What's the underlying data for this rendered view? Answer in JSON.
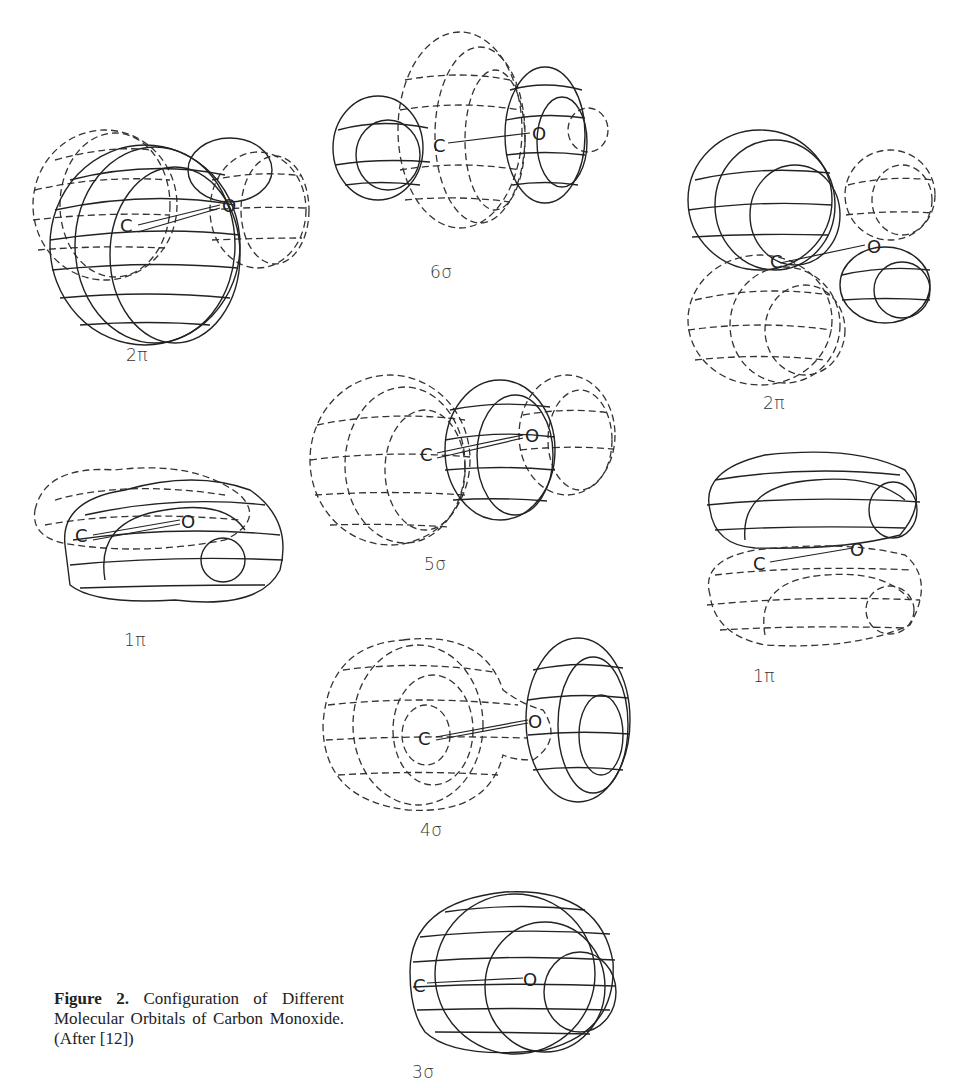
{
  "figure": {
    "caption_label": "Figure 2.",
    "caption_text": "Configuration of Different Molecular Orbitals of Carbon Monoxide. (After [12])",
    "orbitals": [
      {
        "id": "2pi-left",
        "label": "2π",
        "atoms": [
          "C",
          "O"
        ]
      },
      {
        "id": "6sigma",
        "label": "6σ",
        "atoms": [
          "C",
          "O"
        ]
      },
      {
        "id": "2pi-right",
        "label": "2π",
        "atoms": [
          "C",
          "O"
        ]
      },
      {
        "id": "5sigma",
        "label": "5σ",
        "atoms": [
          "C",
          "O"
        ]
      },
      {
        "id": "1pi-left",
        "label": "1π",
        "atoms": [
          "C",
          "O"
        ]
      },
      {
        "id": "1pi-right",
        "label": "1π",
        "atoms": [
          "C",
          "O"
        ]
      },
      {
        "id": "4sigma",
        "label": "4σ",
        "atoms": [
          "C",
          "O"
        ]
      },
      {
        "id": "3sigma",
        "label": "3σ",
        "atoms": [
          "C",
          "O"
        ]
      }
    ],
    "legend": {
      "solid_line": "positive lobe",
      "dashed_line": "negative lobe"
    }
  }
}
